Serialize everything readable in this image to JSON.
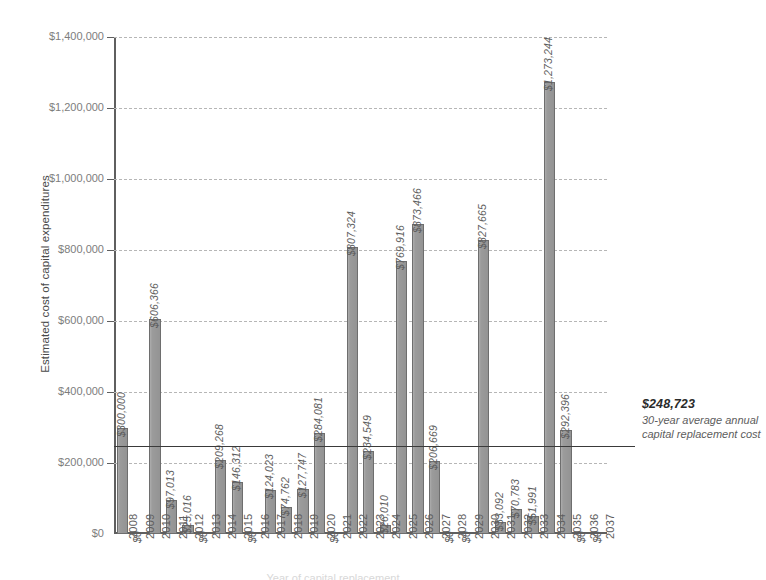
{
  "chart_data": {
    "type": "bar",
    "title": "",
    "xlabel": "",
    "ylabel": "Estimated cost of capital expenditures",
    "ylim": [
      0,
      1400000
    ],
    "ytick_labels": [
      "$0",
      "$200,000",
      "$400,000",
      "$600,000",
      "$800,000",
      "$1,000,000",
      "$1,200,000",
      "$1,400,000"
    ],
    "ytick_values": [
      0,
      200000,
      400000,
      600000,
      800000,
      1000000,
      1200000,
      1400000
    ],
    "grid": true,
    "legend": "none",
    "categories": [
      "2008",
      "2009",
      "2010",
      "2011",
      "2012",
      "2013",
      "2014",
      "2015",
      "2016",
      "2017",
      "2018",
      "2019",
      "2020",
      "2021",
      "2022",
      "2023",
      "2024",
      "2025",
      "2026",
      "2027",
      "2028",
      "2029",
      "2030",
      "2031",
      "2032",
      "2033",
      "2034",
      "2035",
      "2036",
      "2037"
    ],
    "values": [
      300000,
      0,
      606366,
      97013,
      25016,
      0,
      209268,
      146312,
      0,
      124023,
      74762,
      127747,
      284081,
      0,
      807324,
      234549,
      26010,
      769916,
      873466,
      206669,
      0,
      0,
      827665,
      33092,
      70783,
      51991,
      1273244,
      292396,
      0,
      0
    ],
    "value_labels": [
      "$300,000",
      "$0",
      "$606,366",
      "$97,013",
      "$25,016",
      "$0",
      "$209,268",
      "$146,312",
      "$0",
      "$124,023",
      "$74,762",
      "$127,747",
      "$284,081",
      "$0",
      "$807,324",
      "$234,549",
      "$26,010",
      "$769,916",
      "$873,466",
      "$206,669",
      "$0",
      "$0",
      "$827,665",
      "$33,092",
      "$70,783",
      "$51,991",
      "$1,273,244",
      "$292,396",
      "$0",
      "$0"
    ],
    "reference_line": {
      "value": 248723,
      "value_label": "$248,723",
      "description": "30-year average annual capital replacement cost"
    },
    "colors": {
      "bar_fill": "#9b9b9b",
      "bar_stroke": "#6e6e6e",
      "gridline": "#b6b6b6",
      "axis": "#5f5f5f",
      "reference_line": "#3a3a3a",
      "label_text": "#5d5d5d"
    }
  },
  "footer": {
    "cut_off_text": "Year of capital replacement"
  }
}
